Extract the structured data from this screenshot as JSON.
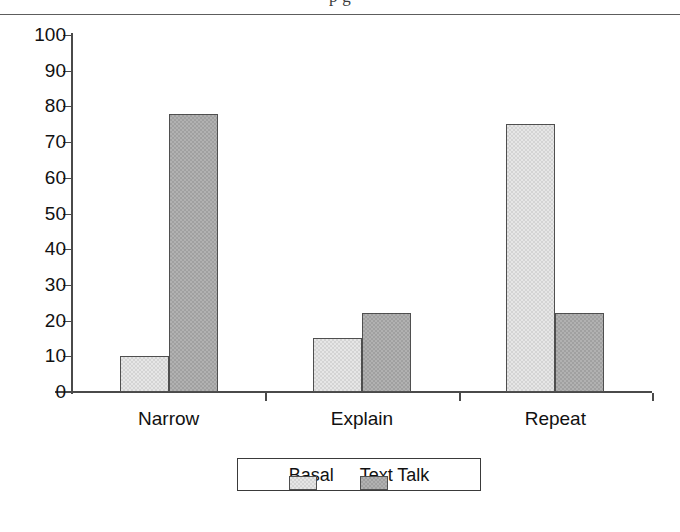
{
  "page": {
    "clipped_title_fragment": "p         g",
    "background_color": "#ffffff"
  },
  "chart_data": {
    "type": "bar",
    "title": "",
    "xlabel": "",
    "ylabel": "",
    "categories": [
      "Narrow",
      "Explain",
      "Repeat"
    ],
    "series": [
      {
        "name": "Basal",
        "color": "#e6e6e6",
        "values": [
          10,
          15,
          75
        ]
      },
      {
        "name": "Text Talk",
        "color": "#a0a0a0",
        "values": [
          78,
          22,
          22
        ]
      }
    ],
    "ylim": [
      0,
      100
    ],
    "ytick_values": [
      0,
      10,
      20,
      30,
      40,
      50,
      60,
      70,
      80,
      90,
      100
    ],
    "ytick_labels": [
      "0",
      "10",
      "20",
      "30",
      "40",
      "50",
      "60",
      "70",
      "80",
      "90",
      "100"
    ],
    "grid": false,
    "legend_position": "bottom-center",
    "legend_entries": [
      "Basal",
      "Text Talk"
    ],
    "bar_border_color": "#4f4f4f",
    "axis_color": "#4a4a4a"
  }
}
